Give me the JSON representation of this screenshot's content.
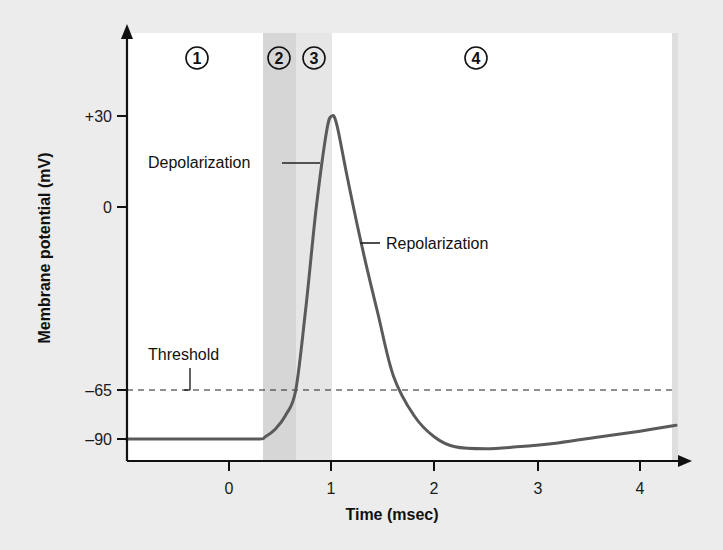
{
  "chart_data": {
    "type": "line",
    "title": "",
    "xlabel": "Time (msec)",
    "ylabel": "Membrane potential (mV)",
    "x_ticks": [
      0,
      1,
      2,
      3,
      4
    ],
    "x_tick_labels": [
      "0",
      "1",
      "2",
      "3",
      "4"
    ],
    "y_ticks": [
      30,
      0,
      -65,
      -90
    ],
    "y_tick_labels": [
      "+30",
      "0",
      "–65",
      "–90"
    ],
    "xlim": [
      -1.0,
      4.35
    ],
    "ylim": [
      -97,
      58
    ],
    "grid": false,
    "threshold": {
      "value": -65,
      "label": "Threshold",
      "style": "dashed"
    },
    "phases": [
      {
        "label": "1",
        "x_start": -1.0,
        "x_end": 0.33,
        "shade": "none"
      },
      {
        "label": "2",
        "x_start": 0.33,
        "x_end": 0.66,
        "shade": "dark"
      },
      {
        "label": "3",
        "x_start": 0.66,
        "x_end": 1.0,
        "shade": "light"
      },
      {
        "label": "4",
        "x_start": 1.0,
        "x_end": 4.35,
        "shade": "none"
      }
    ],
    "series": [
      {
        "name": "Action potential",
        "x": [
          -1.0,
          0.0,
          0.3,
          0.35,
          0.45,
          0.55,
          0.65,
          0.75,
          0.85,
          0.95,
          1.0,
          1.05,
          1.15,
          1.3,
          1.45,
          1.6,
          1.8,
          2.0,
          2.2,
          2.5,
          2.8,
          3.2,
          3.6,
          4.0,
          4.35
        ],
        "y": [
          -90,
          -90,
          -90,
          -89,
          -85,
          -78,
          -65,
          -35,
          0,
          25,
          30,
          27,
          10,
          -15,
          -38,
          -60,
          -78,
          -89,
          -94,
          -95,
          -94,
          -92,
          -89,
          -86,
          -83
        ]
      }
    ],
    "annotations": [
      {
        "text": "Depolarization",
        "points_to": {
          "x": 0.9,
          "y": 10
        }
      },
      {
        "text": "Repolarization",
        "points_to": {
          "x": 1.25,
          "y": -3
        }
      },
      {
        "text": "Threshold",
        "points_to": {
          "x": -0.4,
          "y": -65
        }
      }
    ]
  },
  "labels": {
    "ylabel": "Membrane potential (mV)",
    "xlabel": "Time (msec)",
    "depolarization": "Depolarization",
    "repolarization": "Repolarization",
    "threshold": "Threshold",
    "phase1": "1",
    "phase2": "2",
    "phase3": "3",
    "phase4": "4",
    "xt0": "0",
    "xt1": "1",
    "xt2": "2",
    "xt3": "3",
    "xt4": "4",
    "yt30": "+30",
    "yt0": "0",
    "ytm65": "–65",
    "ytm90": "–90"
  },
  "colors": {
    "curve": "#5a5a5a",
    "panel": "#ffffff",
    "phase2_band": "#d6d6d6",
    "phase3_band": "#e6e6e6",
    "background": "#ececec",
    "axis": "#111111"
  }
}
